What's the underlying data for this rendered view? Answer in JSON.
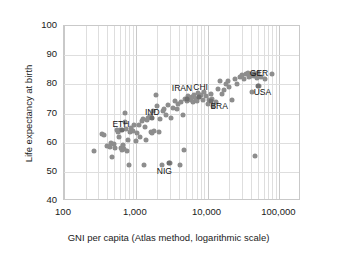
{
  "chart_data": {
    "type": "scatter",
    "title": "",
    "xlabel": "GNI per capita (Atlas method, logarithmic scale)",
    "ylabel": "Life expectancy at birth",
    "xscale": "log",
    "yscale": "linear",
    "xlim": [
      100,
      200000
    ],
    "ylim": [
      40,
      100
    ],
    "grid": true,
    "legend": "none",
    "xticks": [
      {
        "value": 100,
        "label": "100"
      },
      {
        "value": 1000,
        "label": "1,000"
      },
      {
        "value": 10000,
        "label": "10,000"
      },
      {
        "value": 100000,
        "label": "100,000"
      }
    ],
    "yticks": [
      {
        "value": 100,
        "label": "100"
      },
      {
        "value": 90,
        "label": "90"
      },
      {
        "value": 80,
        "label": "80"
      },
      {
        "value": 70,
        "label": "70"
      },
      {
        "value": 60,
        "label": "60"
      },
      {
        "value": 50,
        "label": "50"
      },
      {
        "value": 40,
        "label": "40"
      }
    ],
    "point_color": "#8d8d8d",
    "grid_color": "#dedede",
    "frame_color": "#c9c9c9",
    "points": [
      [
        260,
        57.2
      ],
      [
        340,
        63.0
      ],
      [
        360,
        62.7
      ],
      [
        400,
        59.0
      ],
      [
        430,
        58.6
      ],
      [
        450,
        60.0
      ],
      [
        470,
        55.2
      ],
      [
        490,
        59.4
      ],
      [
        510,
        58.2
      ],
      [
        540,
        64.3
      ],
      [
        560,
        63.6
      ],
      [
        580,
        62.1
      ],
      [
        600,
        64.4
      ],
      [
        620,
        58.3
      ],
      [
        640,
        57.6
      ],
      [
        660,
        59.2
      ],
      [
        680,
        58.0
      ],
      [
        700,
        70.2
      ],
      [
        710,
        67.0
      ],
      [
        730,
        64.8
      ],
      [
        760,
        57.3
      ],
      [
        780,
        61.0
      ],
      [
        800,
        52.3
      ],
      [
        820,
        63.8
      ],
      [
        860,
        65.2
      ],
      [
        900,
        64.0
      ],
      [
        950,
        66.0
      ],
      [
        1000,
        60.6
      ],
      [
        1050,
        63.4
      ],
      [
        1100,
        66.2
      ],
      [
        1150,
        62.0
      ],
      [
        1200,
        67.4
      ],
      [
        1250,
        68.3
      ],
      [
        1300,
        52.2
      ],
      [
        1350,
        65.5
      ],
      [
        1400,
        60.8
      ],
      [
        1450,
        67.8
      ],
      [
        1500,
        68.5
      ],
      [
        1550,
        69.1
      ],
      [
        1600,
        68.7
      ],
      [
        1650,
        63.6
      ],
      [
        1700,
        63.4
      ],
      [
        1750,
        71.0
      ],
      [
        1800,
        64.0
      ],
      [
        1900,
        76.2
      ],
      [
        2000,
        72.5
      ],
      [
        2100,
        63.6
      ],
      [
        2200,
        68.0
      ],
      [
        2300,
        52.4
      ],
      [
        2400,
        70.8
      ],
      [
        2500,
        71.6
      ],
      [
        2600,
        69.4
      ],
      [
        2800,
        73.0
      ],
      [
        3000,
        53.2
      ],
      [
        3100,
        68.5
      ],
      [
        3300,
        72.0
      ],
      [
        3500,
        74.4
      ],
      [
        3700,
        71.4
      ],
      [
        3900,
        73.2
      ],
      [
        4100,
        52.3
      ],
      [
        4300,
        73.8
      ],
      [
        4500,
        69.4
      ],
      [
        4700,
        57.4
      ],
      [
        4900,
        75.0
      ],
      [
        5100,
        74.4
      ],
      [
        5400,
        76.0
      ],
      [
        5600,
        75.2
      ],
      [
        5800,
        74.6
      ],
      [
        6000,
        75.6
      ],
      [
        6200,
        73.8
      ],
      [
        6500,
        76.4
      ],
      [
        6800,
        75.0
      ],
      [
        7000,
        74.2
      ],
      [
        7300,
        77.0
      ],
      [
        7600,
        75.8
      ],
      [
        8000,
        76.2
      ],
      [
        8500,
        74.8
      ],
      [
        9000,
        77.4
      ],
      [
        9500,
        76.0
      ],
      [
        10000,
        73.2
      ],
      [
        10500,
        74.6
      ],
      [
        11000,
        76.6
      ],
      [
        11500,
        75.0
      ],
      [
        12000,
        72.6
      ],
      [
        13000,
        74.0
      ],
      [
        14000,
        78.4
      ],
      [
        15000,
        81.3
      ],
      [
        16000,
        76.8
      ],
      [
        17000,
        78.2
      ],
      [
        18000,
        80.0
      ],
      [
        19000,
        81.2
      ],
      [
        20000,
        79.0
      ],
      [
        22000,
        74.5
      ],
      [
        24000,
        81.8
      ],
      [
        26000,
        80.0
      ],
      [
        28000,
        82.6
      ],
      [
        30000,
        83.2
      ],
      [
        32000,
        82.0
      ],
      [
        34000,
        83.4
      ],
      [
        36000,
        83.8
      ],
      [
        38000,
        82.4
      ],
      [
        40000,
        83.0
      ],
      [
        41000,
        77.4
      ],
      [
        42000,
        83.6
      ],
      [
        44000,
        83.0
      ],
      [
        46000,
        55.6
      ],
      [
        48000,
        82.2
      ],
      [
        50000,
        84.0
      ],
      [
        52000,
        79.6
      ],
      [
        56000,
        82.6
      ],
      [
        62000,
        81.8
      ],
      [
        80000,
        83.6
      ]
    ],
    "annotations": [
      {
        "label": "ETH",
        "x": 620,
        "y": 66.4,
        "point": [
          640,
          64.4
        ]
      },
      {
        "label": "IND",
        "x": 1700,
        "y": 70.6,
        "point": [
          1700,
          68.6
        ]
      },
      {
        "label": "NIG",
        "x": 2500,
        "y": 50.2,
        "point": [
          2900,
          53.2
        ]
      },
      {
        "label": "IRAN",
        "x": 4400,
        "y": 78.6,
        "point": [
          5200,
          75.0
        ]
      },
      {
        "label": "CHI",
        "x": 8000,
        "y": 79.0,
        "point": [
          7600,
          75.6
        ]
      },
      {
        "label": "BRA",
        "x": 14500,
        "y": 72.6,
        "point": [
          11000,
          74.4
        ]
      },
      {
        "label": "GER",
        "x": 52000,
        "y": 84.0,
        "point": [
          44000,
          83.4
        ]
      },
      {
        "label": "USA",
        "x": 58000,
        "y": 77.4,
        "point": [
          50000,
          79.6
        ]
      }
    ]
  }
}
